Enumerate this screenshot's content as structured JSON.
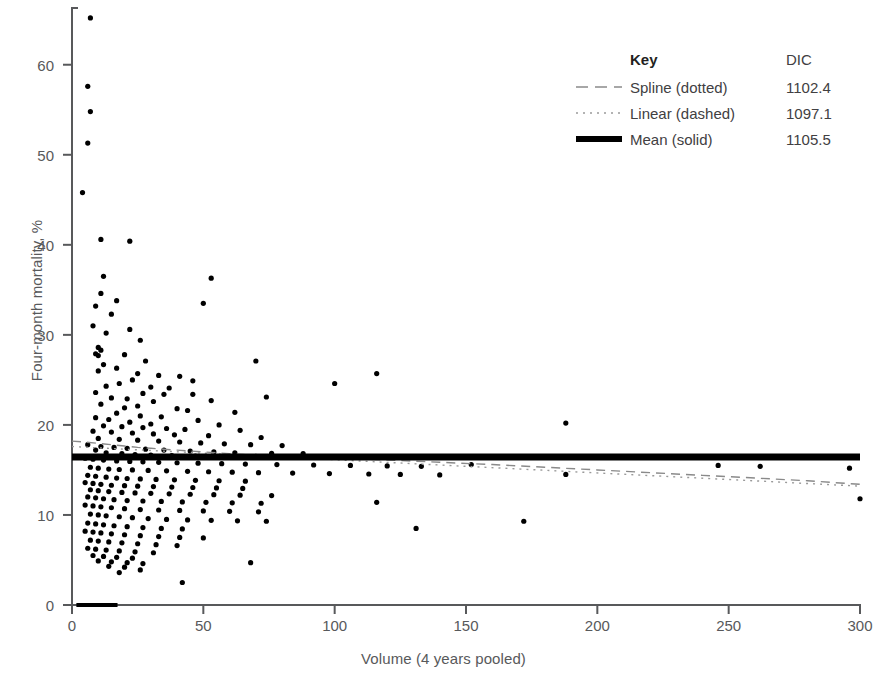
{
  "chart_data": {
    "type": "scatter",
    "title": "",
    "xlabel": "Volume (4 years pooled)",
    "ylabel": "Four-month mortality, %",
    "xlim": [
      0,
      300
    ],
    "ylim": [
      0,
      66.3
    ],
    "xticks": [
      0,
      50,
      100,
      150,
      200,
      250,
      300
    ],
    "yticks": [
      0,
      10,
      20,
      30,
      40,
      50,
      60
    ],
    "grid": false,
    "legend_position": "top-right",
    "legend_title": "Key",
    "legend_value_header": "DIC",
    "series": [
      {
        "name": "Spline (dotted)",
        "style": "dashed",
        "color": "#8a8a8a",
        "dic": "1102.4",
        "x": [
          0,
          5,
          10,
          15,
          20,
          25,
          30,
          35,
          40,
          45,
          50,
          55,
          60,
          65,
          70,
          80,
          90,
          100,
          120,
          140,
          160,
          180,
          200,
          220,
          240,
          260,
          280,
          300
        ],
        "y": [
          18.2,
          18.1,
          17.95,
          17.8,
          17.65,
          17.5,
          17.4,
          17.3,
          17.2,
          17.1,
          17.0,
          16.9,
          16.8,
          16.72,
          16.65,
          16.5,
          16.4,
          16.3,
          16.1,
          15.85,
          15.6,
          15.3,
          15.0,
          14.7,
          14.4,
          14.1,
          13.8,
          13.4
        ]
      },
      {
        "name": "Linear (dashed)",
        "style": "dotted",
        "color": "#9a9a9a",
        "dic": "1097.1",
        "x": [
          0,
          300
        ],
        "y": [
          17.6,
          13.2
        ]
      },
      {
        "name": "Mean (solid)",
        "style": "solid",
        "color": "#000000",
        "dic": "1105.5",
        "x": [
          0,
          300
        ],
        "y": [
          16.45,
          16.45
        ]
      }
    ],
    "points": [
      [
        7,
        65.2
      ],
      [
        6,
        57.6
      ],
      [
        7,
        54.8
      ],
      [
        6,
        51.3
      ],
      [
        4,
        45.8
      ],
      [
        11,
        40.6
      ],
      [
        22,
        40.4
      ],
      [
        12,
        36.5
      ],
      [
        53,
        36.3
      ],
      [
        11,
        34.6
      ],
      [
        17,
        33.8
      ],
      [
        9,
        33.2
      ],
      [
        15,
        32.3
      ],
      [
        50,
        33.5
      ],
      [
        8,
        31.0
      ],
      [
        22,
        30.6
      ],
      [
        13,
        30.2
      ],
      [
        26,
        29.4
      ],
      [
        10,
        28.6
      ],
      [
        11,
        28.3
      ],
      [
        9,
        27.9
      ],
      [
        10,
        27.7
      ],
      [
        20,
        27.8
      ],
      [
        28,
        27.1
      ],
      [
        12,
        26.7
      ],
      [
        70,
        27.1
      ],
      [
        17,
        26.3
      ],
      [
        10,
        26.0
      ],
      [
        25,
        25.7
      ],
      [
        33,
        25.5
      ],
      [
        41,
        25.4
      ],
      [
        116,
        25.7
      ],
      [
        23,
        25.0
      ],
      [
        46,
        24.9
      ],
      [
        100,
        24.6
      ],
      [
        18,
        24.6
      ],
      [
        13,
        24.3
      ],
      [
        30,
        24.2
      ],
      [
        37,
        24.1
      ],
      [
        9,
        23.6
      ],
      [
        27,
        23.5
      ],
      [
        35,
        23.4
      ],
      [
        46,
        23.4
      ],
      [
        74,
        23.1
      ],
      [
        15,
        23.0
      ],
      [
        21,
        22.9
      ],
      [
        31,
        22.6
      ],
      [
        53,
        22.7
      ],
      [
        11,
        22.3
      ],
      [
        25,
        22.1
      ],
      [
        20,
        21.9
      ],
      [
        40,
        21.8
      ],
      [
        44,
        21.6
      ],
      [
        62,
        21.4
      ],
      [
        17,
        21.3
      ],
      [
        26,
        21.0
      ],
      [
        34,
        20.9
      ],
      [
        9,
        20.8
      ],
      [
        14,
        20.6
      ],
      [
        48,
        20.5
      ],
      [
        188,
        20.2
      ],
      [
        22,
        20.3
      ],
      [
        30,
        20.1
      ],
      [
        56,
        20.0
      ],
      [
        12,
        19.9
      ],
      [
        19,
        19.8
      ],
      [
        27,
        19.7
      ],
      [
        36,
        19.6
      ],
      [
        43,
        19.5
      ],
      [
        64,
        19.4
      ],
      [
        8,
        19.3
      ],
      [
        15,
        19.2
      ],
      [
        23,
        19.1
      ],
      [
        31,
        19.0
      ],
      [
        39,
        18.9
      ],
      [
        52,
        18.8
      ],
      [
        72,
        18.6
      ],
      [
        10,
        18.5
      ],
      [
        18,
        18.4
      ],
      [
        25,
        18.3
      ],
      [
        33,
        18.2
      ],
      [
        41,
        18.1
      ],
      [
        49,
        18.0
      ],
      [
        58,
        17.9
      ],
      [
        68,
        17.8
      ],
      [
        80,
        17.7
      ],
      [
        11,
        17.6
      ],
      [
        16,
        17.5
      ],
      [
        21,
        17.4
      ],
      [
        28,
        17.3
      ],
      [
        35,
        17.2
      ],
      [
        45,
        17.1
      ],
      [
        54,
        17.0
      ],
      [
        62,
        16.9
      ],
      [
        76,
        16.85
      ],
      [
        88,
        16.8
      ],
      [
        6,
        17.8
      ],
      [
        9,
        17.2
      ],
      [
        13,
        16.9
      ],
      [
        19,
        16.8
      ],
      [
        24,
        16.7
      ],
      [
        30,
        16.65
      ],
      [
        38,
        16.6
      ],
      [
        47,
        16.55
      ],
      [
        60,
        16.5
      ],
      [
        70,
        16.5
      ],
      [
        85,
        16.45
      ],
      [
        97,
        16.45
      ],
      [
        112,
        16.4
      ],
      [
        128,
        16.4
      ],
      [
        5,
        16.3
      ],
      [
        8,
        16.2
      ],
      [
        12,
        16.1
      ],
      [
        17,
        16.0
      ],
      [
        22,
        15.95
      ],
      [
        27,
        15.9
      ],
      [
        33,
        15.85
      ],
      [
        40,
        15.8
      ],
      [
        48,
        15.75
      ],
      [
        57,
        15.7
      ],
      [
        66,
        15.65
      ],
      [
        78,
        15.6
      ],
      [
        92,
        15.55
      ],
      [
        106,
        15.5
      ],
      [
        120,
        15.45
      ],
      [
        133,
        15.4
      ],
      [
        152,
        15.6
      ],
      [
        7,
        15.3
      ],
      [
        10,
        15.2
      ],
      [
        14,
        15.1
      ],
      [
        18,
        15.05
      ],
      [
        23,
        15.0
      ],
      [
        29,
        14.95
      ],
      [
        36,
        14.9
      ],
      [
        44,
        14.85
      ],
      [
        52,
        14.8
      ],
      [
        61,
        14.75
      ],
      [
        71,
        14.7
      ],
      [
        84,
        14.65
      ],
      [
        98,
        14.6
      ],
      [
        113,
        14.55
      ],
      [
        125,
        14.5
      ],
      [
        140,
        14.45
      ],
      [
        188,
        14.5
      ],
      [
        246,
        15.5
      ],
      [
        262,
        15.4
      ],
      [
        296,
        15.2
      ],
      [
        6,
        14.4
      ],
      [
        9,
        14.3
      ],
      [
        13,
        14.2
      ],
      [
        17,
        14.1
      ],
      [
        21,
        14.05
      ],
      [
        26,
        14.0
      ],
      [
        32,
        13.95
      ],
      [
        39,
        13.9
      ],
      [
        47,
        13.85
      ],
      [
        56,
        13.8
      ],
      [
        66,
        13.75
      ],
      [
        300,
        11.8
      ],
      [
        5,
        13.6
      ],
      [
        8,
        13.5
      ],
      [
        11,
        13.4
      ],
      [
        15,
        13.3
      ],
      [
        20,
        13.25
      ],
      [
        25,
        13.2
      ],
      [
        31,
        13.15
      ],
      [
        38,
        13.1
      ],
      [
        46,
        13.05
      ],
      [
        55,
        13.0
      ],
      [
        65,
        12.95
      ],
      [
        7,
        12.8
      ],
      [
        10,
        12.7
      ],
      [
        14,
        12.6
      ],
      [
        19,
        12.5
      ],
      [
        24,
        12.45
      ],
      [
        30,
        12.4
      ],
      [
        37,
        12.35
      ],
      [
        45,
        12.3
      ],
      [
        54,
        12.25
      ],
      [
        64,
        12.2
      ],
      [
        76,
        12.15
      ],
      [
        6,
        12.0
      ],
      [
        9,
        11.9
      ],
      [
        12,
        11.8
      ],
      [
        16,
        11.7
      ],
      [
        21,
        11.6
      ],
      [
        27,
        11.55
      ],
      [
        34,
        11.5
      ],
      [
        42,
        11.45
      ],
      [
        51,
        11.4
      ],
      [
        61,
        11.35
      ],
      [
        72,
        11.3
      ],
      [
        116,
        11.4
      ],
      [
        5,
        11.1
      ],
      [
        8,
        11.0
      ],
      [
        11,
        10.9
      ],
      [
        15,
        10.8
      ],
      [
        20,
        10.7
      ],
      [
        26,
        10.6
      ],
      [
        33,
        10.55
      ],
      [
        41,
        10.5
      ],
      [
        50,
        10.45
      ],
      [
        60,
        10.4
      ],
      [
        71,
        10.35
      ],
      [
        7,
        10.1
      ],
      [
        10,
        10.0
      ],
      [
        13,
        9.9
      ],
      [
        18,
        9.8
      ],
      [
        23,
        9.7
      ],
      [
        29,
        9.6
      ],
      [
        36,
        9.5
      ],
      [
        44,
        9.45
      ],
      [
        53,
        9.4
      ],
      [
        63,
        9.35
      ],
      [
        74,
        9.3
      ],
      [
        6,
        9.1
      ],
      [
        9,
        9.0
      ],
      [
        12,
        8.9
      ],
      [
        16,
        8.8
      ],
      [
        21,
        8.7
      ],
      [
        27,
        8.6
      ],
      [
        34,
        8.5
      ],
      [
        42,
        8.45
      ],
      [
        131,
        8.5
      ],
      [
        172,
        9.3
      ],
      [
        5,
        8.2
      ],
      [
        8,
        8.1
      ],
      [
        11,
        8.0
      ],
      [
        15,
        7.9
      ],
      [
        20,
        7.8
      ],
      [
        26,
        7.7
      ],
      [
        33,
        7.6
      ],
      [
        41,
        7.5
      ],
      [
        50,
        7.45
      ],
      [
        7,
        7.2
      ],
      [
        10,
        7.1
      ],
      [
        14,
        7.0
      ],
      [
        19,
        6.9
      ],
      [
        25,
        6.8
      ],
      [
        32,
        6.7
      ],
      [
        40,
        6.6
      ],
      [
        6,
        6.3
      ],
      [
        9,
        6.2
      ],
      [
        13,
        6.1
      ],
      [
        18,
        6.0
      ],
      [
        24,
        5.9
      ],
      [
        31,
        5.8
      ],
      [
        8,
        5.5
      ],
      [
        12,
        5.4
      ],
      [
        17,
        5.3
      ],
      [
        23,
        5.2
      ],
      [
        68,
        4.7
      ],
      [
        10,
        4.9
      ],
      [
        15,
        4.8
      ],
      [
        21,
        4.7
      ],
      [
        27,
        4.6
      ],
      [
        14,
        4.3
      ],
      [
        20,
        4.2
      ],
      [
        42,
        2.5
      ],
      [
        26,
        3.9
      ],
      [
        18,
        3.6
      ],
      [
        3,
        0.0
      ],
      [
        5,
        0.0
      ],
      [
        6,
        0.0
      ],
      [
        7,
        0.0
      ],
      [
        8,
        0.0
      ],
      [
        9,
        0.0
      ],
      [
        10,
        0.0
      ],
      [
        11,
        0.0
      ],
      [
        12,
        0.0
      ],
      [
        14,
        0.0
      ],
      [
        15,
        0.0
      ],
      [
        16,
        0.0
      ]
    ]
  }
}
